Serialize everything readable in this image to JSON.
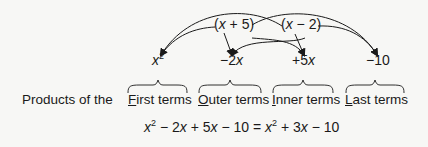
{
  "factors": [
    {
      "open": "(",
      "var": "x",
      "op": " + ",
      "num": "5",
      "close": ")"
    },
    {
      "open": "(",
      "var": "x",
      "op": " − ",
      "num": "2",
      "close": ")"
    }
  ],
  "products": [
    {
      "var": "x",
      "exp": "2",
      "prefix": "",
      "suffix": ""
    },
    {
      "prefix": "−2",
      "var": "x"
    },
    {
      "prefix": "+5",
      "var": "x"
    },
    {
      "prefix": "−10",
      "var": ""
    }
  ],
  "labels": {
    "lead": "Products of the",
    "first": {
      "initial": "F",
      "rest": "irst terms"
    },
    "outer": {
      "initial": "O",
      "rest": "uter terms"
    },
    "inner": {
      "initial": "I",
      "rest": "nner terms"
    },
    "last": {
      "initial": "L",
      "rest": "ast terms"
    }
  },
  "equation": {
    "t1_var": "x",
    "t1_exp": "2",
    "t2": " − 2",
    "t2_var": "x",
    "t3": " + 5",
    "t3_var": "x",
    "t4": " − 10 = ",
    "r1_var": "x",
    "r1_exp": "2",
    "r2": " + 3",
    "r2_var": "x",
    "r3": " − 10"
  },
  "colors": {
    "ink": "#1a1a1a",
    "background": "#f7f7f5"
  }
}
